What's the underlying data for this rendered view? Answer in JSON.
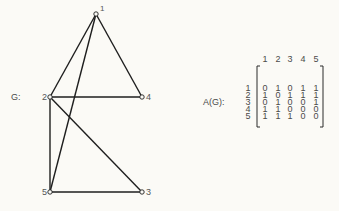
{
  "graph": {
    "label": "G:",
    "nodes": [
      {
        "id": "1",
        "label": "1",
        "x": 96,
        "y": 14
      },
      {
        "id": "2",
        "label": "2",
        "x": 50,
        "y": 97
      },
      {
        "id": "3",
        "label": "3",
        "x": 142,
        "y": 192
      },
      {
        "id": "4",
        "label": "4",
        "x": 142,
        "y": 97
      },
      {
        "id": "5",
        "label": "5",
        "x": 50,
        "y": 192
      }
    ],
    "edges": [
      [
        "1",
        "2"
      ],
      [
        "1",
        "4"
      ],
      [
        "1",
        "5"
      ],
      [
        "2",
        "4"
      ],
      [
        "2",
        "5"
      ],
      [
        "2",
        "3"
      ],
      [
        "5",
        "3"
      ]
    ]
  },
  "matrix": {
    "label": "A(G):",
    "column_headers": [
      "1",
      "2",
      "3",
      "4",
      "5"
    ],
    "row_headers": [
      "1",
      "2",
      "3",
      "4",
      "5"
    ],
    "rows": [
      [
        "0",
        "1",
        "0",
        "1",
        "1"
      ],
      [
        "1",
        "0",
        "1",
        "1",
        "1"
      ],
      [
        "0",
        "1",
        "0",
        "0",
        "1"
      ],
      [
        "1",
        "1",
        "0",
        "0",
        "0"
      ],
      [
        "1",
        "1",
        "1",
        "0",
        "0"
      ]
    ]
  },
  "colors": {
    "background": "#fbfaf6",
    "line": "#1e1e1e",
    "text": "#4a4a4a"
  }
}
